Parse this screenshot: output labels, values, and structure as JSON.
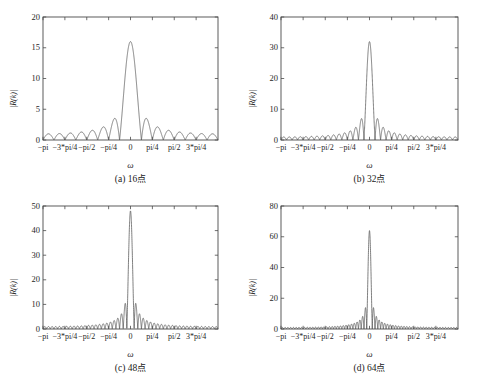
{
  "figure": {
    "background": "#ffffff",
    "line_color": "#555555",
    "axis_color": "#4a4a4a",
    "panel_count": 4
  },
  "chart_data": [
    {
      "type": "line",
      "panel_id": "a",
      "title": "(a) 16",
      "title_suffix": "点",
      "caption_full": "(a) 16点",
      "N": 16,
      "xlabel": "ω",
      "ylabel": "|R(k)|",
      "grid": false,
      "legend": "none",
      "xlim": [
        -3.14159265,
        3.14159265
      ],
      "ylim": [
        0,
        20
      ],
      "yticks": [
        0,
        5,
        10,
        15,
        20
      ],
      "ytick_labels": [
        "0",
        "5",
        "10",
        "15",
        "20"
      ],
      "xticks": [
        -3.14159265,
        -2.35619449,
        -1.57079633,
        -0.78539816,
        0,
        0.78539816,
        1.57079633,
        2.35619449
      ],
      "xtick_labels": [
        "-pi",
        "-3*pi/4",
        "-pi/2",
        "-pi/4",
        "0",
        "pi/4",
        "pi/2",
        "3*pi/4"
      ],
      "peak_value": 16,
      "peak_x": 0,
      "description": "Magnitude of DFT of 16-point rectangular window; Dirichlet kernel |sin(N*w/2)/sin(w/2)|"
    },
    {
      "type": "line",
      "panel_id": "b",
      "title": "(b) 32",
      "title_suffix": "点",
      "caption_full": "(b) 32点",
      "N": 32,
      "xlabel": "ω",
      "ylabel": "|R(k)|",
      "grid": false,
      "legend": "none",
      "xlim": [
        -3.14159265,
        3.14159265
      ],
      "ylim": [
        0,
        40
      ],
      "yticks": [
        0,
        10,
        20,
        30,
        40
      ],
      "ytick_labels": [
        "0",
        "10",
        "20",
        "30",
        "40"
      ],
      "xticks": [
        -3.14159265,
        -2.35619449,
        -1.57079633,
        -0.78539816,
        0,
        0.78539816,
        1.57079633,
        2.35619449
      ],
      "xtick_labels": [
        "-pi",
        "-3*pi/4",
        "-pi/2",
        "-pi/4",
        "0",
        "pi/4",
        "pi/2",
        "3*pi/4"
      ],
      "peak_value": 32,
      "peak_x": 0,
      "description": "Magnitude of DFT of 32-point rectangular window"
    },
    {
      "type": "line",
      "panel_id": "c",
      "title": "(c) 48",
      "title_suffix": "点",
      "caption_full": "(c) 48点",
      "N": 48,
      "xlabel": "ω",
      "ylabel": "|R(k)|",
      "grid": false,
      "legend": "none",
      "xlim": [
        -3.14159265,
        3.14159265
      ],
      "ylim": [
        0,
        50
      ],
      "yticks": [
        0,
        10,
        20,
        30,
        40,
        50
      ],
      "ytick_labels": [
        "0",
        "10",
        "20",
        "30",
        "40",
        "50"
      ],
      "xticks": [
        -3.14159265,
        -2.35619449,
        -1.57079633,
        -0.78539816,
        0,
        0.78539816,
        1.57079633,
        2.35619449
      ],
      "xtick_labels": [
        "-pi",
        "-3*pi/4",
        "-pi/2",
        "-pi/4",
        "0",
        "pi/4",
        "pi/2",
        "3*pi/4"
      ],
      "peak_value": 48,
      "peak_x": 0,
      "description": "Magnitude of DFT of 48-point rectangular window"
    },
    {
      "type": "line",
      "panel_id": "d",
      "title": "(d) 64",
      "title_suffix": "点",
      "caption_full": "(d) 64点",
      "N": 64,
      "xlabel": "ω",
      "ylabel": "|R(k)|",
      "grid": false,
      "legend": "none",
      "xlim": [
        -3.14159265,
        3.14159265
      ],
      "ylim": [
        0,
        80
      ],
      "yticks": [
        0,
        20,
        40,
        60,
        80
      ],
      "ytick_labels": [
        "0",
        "20",
        "40",
        "60",
        "80"
      ],
      "xticks": [
        -3.14159265,
        -2.35619449,
        -1.57079633,
        -0.78539816,
        0,
        0.78539816,
        1.57079633,
        2.35619449
      ],
      "xtick_labels": [
        "-pi",
        "-3*pi/4",
        "-pi/2",
        "-pi/4",
        "0",
        "pi/4",
        "pi/2",
        "3*pi/4"
      ],
      "peak_value": 64,
      "peak_x": 0,
      "description": "Magnitude of DFT of 64-point rectangular window"
    }
  ]
}
